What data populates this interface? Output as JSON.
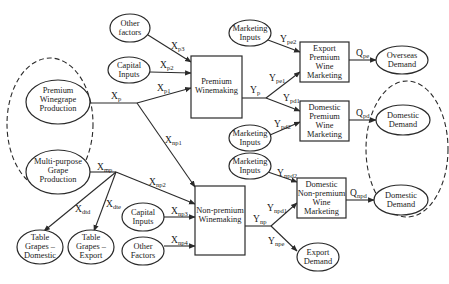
{
  "diagram": {
    "nodes": {
      "other_factors_top": {
        "shape": "ellipse",
        "lines": [
          "Other",
          "factors"
        ]
      },
      "capital_inputs_top": {
        "shape": "ellipse",
        "lines": [
          "Capital",
          "Inputs"
        ]
      },
      "premium_winegrape_production": {
        "shape": "ellipse",
        "lines": [
          "Premium",
          "Winegrape",
          "Production"
        ]
      },
      "multi_purpose_grape_production": {
        "shape": "ellipse",
        "lines": [
          "Multi-purpose",
          "Grape",
          "Production"
        ]
      },
      "table_grapes_domestic": {
        "shape": "ellipse",
        "lines": [
          "Table",
          "Grapes –",
          "Domestic"
        ]
      },
      "table_grapes_export": {
        "shape": "ellipse",
        "lines": [
          "Table",
          "Grapes –",
          "Export"
        ]
      },
      "premium_winemaking": {
        "shape": "box",
        "lines": [
          "Premium",
          "Winemaking"
        ]
      },
      "non_premium_winemaking": {
        "shape": "box",
        "lines": [
          "Non-premium",
          "Winemaking"
        ]
      },
      "capital_inputs_bottom": {
        "shape": "ellipse",
        "lines": [
          "Capital",
          "Inputs"
        ]
      },
      "other_factors_bottom": {
        "shape": "ellipse",
        "lines": [
          "Other",
          "Factors"
        ]
      },
      "marketing_inputs_1": {
        "shape": "ellipse",
        "lines": [
          "Marketing",
          "Inputs"
        ]
      },
      "marketing_inputs_2": {
        "shape": "ellipse",
        "lines": [
          "Marketing",
          "Inputs"
        ]
      },
      "marketing_inputs_3": {
        "shape": "ellipse",
        "lines": [
          "Marketing",
          "Inputs"
        ]
      },
      "export_premium_wine_marketing": {
        "shape": "box",
        "lines": [
          "Export",
          "Premium",
          "Wine",
          "Marketing"
        ]
      },
      "domestic_premium_wine_marketing": {
        "shape": "box",
        "lines": [
          "Domestic",
          "Premium",
          "Wine",
          "Marketing"
        ]
      },
      "domestic_non_premium_wine_marketing": {
        "shape": "box",
        "lines": [
          "Domestic",
          "Non-premium",
          "Wine",
          "Marketing"
        ]
      },
      "overseas_demand": {
        "shape": "ellipse",
        "lines": [
          "Overseas",
          "Demand"
        ]
      },
      "domestic_demand_premium": {
        "shape": "ellipse",
        "lines": [
          "Domestic",
          "Demand"
        ]
      },
      "domestic_demand_non_premium": {
        "shape": "ellipse",
        "lines": [
          "Domestic",
          "Demand"
        ]
      },
      "export_demand": {
        "shape": "ellipse",
        "lines": [
          "Export",
          "Demand"
        ]
      }
    },
    "edge_labels": {
      "xp3": {
        "main": "X",
        "sub": "p3"
      },
      "xp2": {
        "main": "X",
        "sub": "p2"
      },
      "xp": {
        "main": "X",
        "sub": "p"
      },
      "xp1": {
        "main": "X",
        "sub": "p1"
      },
      "xnp1": {
        "main": "X",
        "sub": "np1"
      },
      "xmp": {
        "main": "X",
        "sub": "mp"
      },
      "xnp2": {
        "main": "X",
        "sub": "np2"
      },
      "xdtd": {
        "main": "X",
        "sub": "dtd"
      },
      "xdte": {
        "main": "X",
        "sub": "dte"
      },
      "xnp3": {
        "main": "X",
        "sub": "np3"
      },
      "xnp4": {
        "main": "X",
        "sub": "np4"
      },
      "ype2": {
        "main": "Y",
        "sub": "pe2"
      },
      "ype1": {
        "main": "Y",
        "sub": "pe1"
      },
      "yp": {
        "main": "Y",
        "sub": "p"
      },
      "ypd1": {
        "main": "Y",
        "sub": "pd1"
      },
      "ypd2": {
        "main": "Y",
        "sub": "pd2"
      },
      "qpe": {
        "main": "Q",
        "sub": "pe"
      },
      "qpd": {
        "main": "Q",
        "sub": "pd"
      },
      "ynpd2": {
        "main": "Y",
        "sub": "npd2"
      },
      "ynpd1": {
        "main": "Y",
        "sub": "npd1"
      },
      "ynp": {
        "main": "Y",
        "sub": "np"
      },
      "ynpe": {
        "main": "Y",
        "sub": "npe"
      },
      "qnpd": {
        "main": "Q",
        "sub": "npd"
      }
    },
    "groups": {
      "grape_production_group": "dashed-ellipse",
      "domestic_demand_group": "dashed-ellipse"
    },
    "colors": {
      "stroke": "#2a2a2a",
      "background": "#ffffff",
      "text": "#1a1a1a"
    }
  }
}
